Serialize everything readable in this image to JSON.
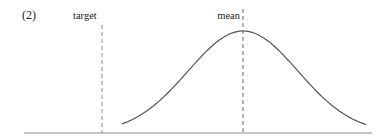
{
  "figure": {
    "panel_label": "(2)",
    "target_label": "target",
    "mean_label": "mean"
  },
  "chart_data": {
    "type": "line",
    "title": "",
    "panel": "(2)",
    "xlabel": "",
    "ylabel": "",
    "grid": false,
    "series": [
      {
        "name": "distribution",
        "shape": "bell curve (normal density)",
        "peak_at": "mean"
      }
    ],
    "annotations": [
      {
        "type": "vertical-dashed-line",
        "label": "target",
        "position": "left of curve support"
      },
      {
        "type": "vertical-dashed-line",
        "label": "mean",
        "position": "at curve peak"
      }
    ]
  },
  "colors": {
    "line": "#555555",
    "axis": "#888888",
    "text": "#222222"
  }
}
